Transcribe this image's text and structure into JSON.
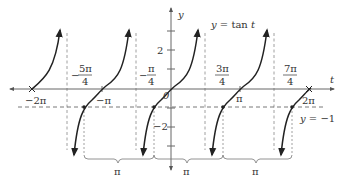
{
  "figure": {
    "equation_label": "y = tan t",
    "line_label": "y = −1",
    "axes": {
      "x_label": "t",
      "y_label": "y",
      "origin_label": "0",
      "y_tick_labels": {
        "pos2": "2",
        "neg2": "−2"
      }
    },
    "x_tick_labels": {
      "neg2pi": "−2π",
      "negpi": "−π",
      "pi": "π",
      "twopi": "2π"
    },
    "fraction_labels": [
      {
        "sign": "−",
        "num": "5π",
        "den": "4"
      },
      {
        "sign": "−",
        "num": "π",
        "den": "4"
      },
      {
        "sign": "",
        "num": "3π",
        "den": "4"
      },
      {
        "sign": "",
        "num": "7π",
        "den": "4"
      }
    ],
    "brace_labels": [
      "π",
      "π",
      "π"
    ],
    "period": "π",
    "highlighted_solutions": [
      "−5π/4",
      "−π/4",
      "3π/4",
      "7π/4"
    ]
  },
  "colors": {
    "curve": "#222222",
    "axis": "#666666",
    "dashed": "#888888",
    "background": "#ffffff"
  }
}
